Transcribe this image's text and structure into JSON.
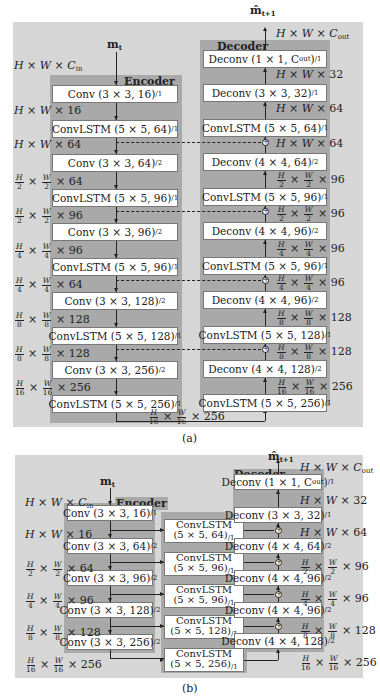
{
  "figure_a": {
    "caption": "(a)",
    "input_symbol": "m",
    "input_sub": "t",
    "output_symbol": "m̂",
    "output_sub": "t+1",
    "encoder_title": "Encoder",
    "decoder_title": "Decoder",
    "encoder_layers": [
      {
        "label": "Conv (3 × 3, 16)",
        "stride": "/1"
      },
      {
        "label": "ConvLSTM (5 × 5, 64)",
        "stride": "/1"
      },
      {
        "label": "Conv (3 × 3, 64)",
        "stride": "/2"
      },
      {
        "label": "ConvLSTM (5 × 5, 96)",
        "stride": "/1"
      },
      {
        "label": "Conv (3 × 3, 96)",
        "stride": "/2"
      },
      {
        "label": "ConvLSTM (5 × 5, 96)",
        "stride": "/1"
      },
      {
        "label": "Conv (3 × 3, 128)",
        "stride": "/2"
      },
      {
        "label": "ConvLSTM (5 × 5, 128)",
        "stride": "/1"
      },
      {
        "label": "Conv (3 × 3, 256)",
        "stride": "/2"
      },
      {
        "label": "ConvLSTM (5 × 5, 256)",
        "stride": "/1"
      }
    ],
    "encoder_dims": [
      {
        "h": "H",
        "w": "W",
        "c": "C",
        "c_sub": "in",
        "frac": false
      },
      {
        "h": "H",
        "w": "W",
        "c": "16",
        "frac": false
      },
      {
        "h": "H",
        "w": "W",
        "c": "64",
        "frac": false
      },
      {
        "h": "H",
        "hd": "2",
        "w": "W",
        "wd": "2",
        "c": "64",
        "frac": true
      },
      {
        "h": "H",
        "hd": "2",
        "w": "W",
        "wd": "2",
        "c": "96",
        "frac": true
      },
      {
        "h": "H",
        "hd": "4",
        "w": "W",
        "wd": "4",
        "c": "96",
        "frac": true
      },
      {
        "h": "H",
        "hd": "4",
        "w": "W",
        "wd": "4",
        "c": "64",
        "frac": true
      },
      {
        "h": "H",
        "hd": "8",
        "w": "W",
        "wd": "8",
        "c": "128",
        "frac": true
      },
      {
        "h": "H",
        "hd": "8",
        "w": "W",
        "wd": "8",
        "c": "128",
        "frac": true
      },
      {
        "h": "H",
        "hd": "16",
        "w": "W",
        "wd": "16",
        "c": "256",
        "frac": true
      }
    ],
    "bottleneck_dim": {
      "h": "H",
      "hd": "16",
      "w": "W",
      "wd": "16",
      "c": "256"
    },
    "decoder_layers": [
      {
        "label": "Deconv (1 × 1, C",
        "label_sub": "out",
        "label_end": ")",
        "stride": "/1"
      },
      {
        "label": "Deconv (3 × 3, 32)",
        "stride": "/1"
      },
      {
        "label": "ConvLSTM (5 × 5, 64)",
        "stride": "/1"
      },
      {
        "label": "Deconv (4 × 4, 64)",
        "stride": "/2"
      },
      {
        "label": "ConvLSTM (5 × 5, 96)",
        "stride": "/1"
      },
      {
        "label": "Deconv (4 × 4, 96)",
        "stride": "/2"
      },
      {
        "label": "ConvLSTM (5 × 5, 96)",
        "stride": "/1"
      },
      {
        "label": "Deconv (4 × 4, 96)",
        "stride": "/2"
      },
      {
        "label": "ConvLSTM (5 × 5, 128)",
        "stride": "/1"
      },
      {
        "label": "Deconv (4 × 4, 128)",
        "stride": "/2"
      },
      {
        "label": "ConvLSTM (5 × 5, 256)",
        "stride": "/1"
      }
    ],
    "decoder_dims": [
      {
        "h": "H",
        "w": "W",
        "c": "C",
        "c_sub": "out",
        "frac": false
      },
      {
        "h": "H",
        "w": "W",
        "c": "32",
        "frac": false
      },
      {
        "h": "H",
        "w": "W",
        "c": "64",
        "frac": false
      },
      {
        "h": "H",
        "w": "W",
        "c": "64",
        "frac": false
      },
      {
        "h": "H",
        "hd": "2",
        "w": "W",
        "wd": "2",
        "c": "96",
        "frac": true
      },
      {
        "h": "H",
        "hd": "2",
        "w": "W",
        "wd": "2",
        "c": "96",
        "frac": true
      },
      {
        "h": "H",
        "hd": "4",
        "w": "W",
        "wd": "4",
        "c": "96",
        "frac": true
      },
      {
        "h": "H",
        "hd": "4",
        "w": "W",
        "wd": "4",
        "c": "96",
        "frac": true
      },
      {
        "h": "H",
        "hd": "8",
        "w": "W",
        "wd": "8",
        "c": "128",
        "frac": true
      },
      {
        "h": "H",
        "hd": "8",
        "w": "W",
        "wd": "8",
        "c": "128",
        "frac": true
      },
      {
        "h": "H",
        "hd": "16",
        "w": "W",
        "wd": "16",
        "c": "256",
        "frac": true
      }
    ]
  },
  "figure_b": {
    "caption": "(b)",
    "input_symbol": "m",
    "input_sub": "t",
    "output_symbol": "m̂",
    "output_sub": "t+1",
    "encoder_title": "Encoder",
    "decoder_title": "Decoder",
    "encoder_layers": [
      {
        "label": "Conv (3 × 3, 16)",
        "stride": "/1"
      },
      {
        "label": "Conv (3 × 3, 64)",
        "stride": "/2"
      },
      {
        "label": "Conv (3 × 3, 96)",
        "stride": "/2"
      },
      {
        "label": "Conv (3 × 3, 128)",
        "stride": "/2"
      },
      {
        "label": "Conv (3 × 3, 256)",
        "stride": "/2"
      }
    ],
    "encoder_dims": [
      {
        "h": "H",
        "w": "W",
        "c": "C",
        "c_sub": "in",
        "frac": false
      },
      {
        "h": "H",
        "w": "W",
        "c": "16",
        "frac": false
      },
      {
        "h": "H",
        "hd": "2",
        "w": "W",
        "wd": "2",
        "c": "64",
        "frac": true
      },
      {
        "h": "H",
        "hd": "4",
        "w": "W",
        "wd": "4",
        "c": "96",
        "frac": true
      },
      {
        "h": "H",
        "hd": "8",
        "w": "W",
        "wd": "8",
        "c": "128",
        "frac": true
      },
      {
        "h": "H",
        "hd": "16",
        "w": "W",
        "wd": "16",
        "c": "256",
        "frac": true
      }
    ],
    "convlstm_layers": [
      {
        "line1": "ConvLSTM",
        "line2": "(5 × 5, 64)",
        "stride": "/1"
      },
      {
        "line1": "ConvLSTM",
        "line2": "(5 × 5, 96)",
        "stride": "/1"
      },
      {
        "line1": "ConvLSTM",
        "line2": "(5 × 5, 96)",
        "stride": "/1"
      },
      {
        "line1": "ConvLSTM",
        "line2": "(5 × 5, 128)",
        "stride": "/1"
      },
      {
        "line1": "ConvLSTM",
        "line2": "(5 × 5, 256)",
        "stride": "/1"
      }
    ],
    "decoder_layers": [
      {
        "label": "Deconv (1 × 1, C",
        "label_sub": "out",
        "label_end": ")",
        "stride": "/1"
      },
      {
        "label": "Deconv (3 × 3, 32)",
        "stride": "/1"
      },
      {
        "label": "Deconv (4 × 4, 64)",
        "stride": "/2"
      },
      {
        "label": "Deconv (4 × 4, 96)",
        "stride": "/2"
      },
      {
        "label": "Deconv (4 × 4, 96)",
        "stride": "/2"
      },
      {
        "label": "Deconv (4 × 4, 128)",
        "stride": "/2"
      }
    ],
    "decoder_dims": [
      {
        "h": "H",
        "w": "W",
        "c": "C",
        "c_sub": "out",
        "frac": false
      },
      {
        "h": "H",
        "w": "W",
        "c": "32",
        "frac": false
      },
      {
        "h": "H",
        "w": "W",
        "c": "64",
        "frac": false
      },
      {
        "h": "H",
        "hd": "2",
        "w": "W",
        "wd": "2",
        "c": "96",
        "frac": true
      },
      {
        "h": "H",
        "hd": "4",
        "w": "W",
        "wd": "4",
        "c": "96",
        "frac": true
      },
      {
        "h": "H",
        "hd": "8",
        "w": "W",
        "wd": "8",
        "c": "128",
        "frac": true
      },
      {
        "h": "H",
        "hd": "16",
        "w": "W",
        "wd": "16",
        "c": "256",
        "frac": true
      }
    ]
  },
  "colors": {
    "panel": "#d6d6d6",
    "column": "#a9a9a9",
    "box": "#ffffff",
    "line": "#222222"
  }
}
